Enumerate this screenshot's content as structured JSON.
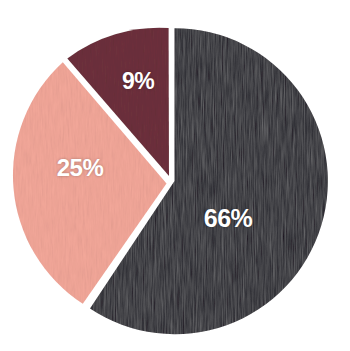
{
  "chart_data": {
    "type": "pie",
    "title": "",
    "subtitle": "",
    "xlabel": "",
    "ylabel": "",
    "legend": "none",
    "grid": false,
    "units": "percent",
    "total": 100,
    "categories": [
      "Segment 1",
      "Segment 2",
      "Segment 3"
    ],
    "values": [
      66,
      25,
      9
    ],
    "labels": [
      "66%",
      "25%",
      "9%"
    ],
    "colors": [
      "#120b1c",
      "#f4a89a",
      "#6e313d"
    ],
    "slices": [
      {
        "name": "Segment 1",
        "value": 66,
        "label": "66%",
        "color": "#120b1c",
        "start_angle_deg": 0,
        "end_angle_deg": 237.6,
        "exploded": false,
        "label_x": 228,
        "label_y": 218
      },
      {
        "name": "Segment 2",
        "value": 25,
        "label": "25%",
        "color": "#f4a89a",
        "start_angle_deg": 237.6,
        "end_angle_deg": 327.6,
        "exploded": true,
        "label_x": 80,
        "label_y": 168
      },
      {
        "name": "Segment 3",
        "value": 9,
        "label": "9%",
        "color": "#6e313d",
        "start_angle_deg": 327.6,
        "end_angle_deg": 360,
        "exploded": false,
        "label_x": 138,
        "label_y": 81
      }
    ],
    "geometry": {
      "center_x": 171,
      "center_y": 181,
      "radius": 153,
      "gap_px": 4
    },
    "background_color": "#ffffff",
    "label_text_color": "#ffffff"
  },
  "figure": {
    "width": 350,
    "height": 351
  }
}
